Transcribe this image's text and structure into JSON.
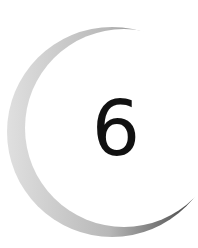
{
  "chapter": {
    "number": "6",
    "ornament": "crescent-arc",
    "colors": {
      "background": "#ffffff",
      "digit": "#111111",
      "arc_light": "#d4d4d4",
      "arc_dark": "#555555"
    }
  }
}
